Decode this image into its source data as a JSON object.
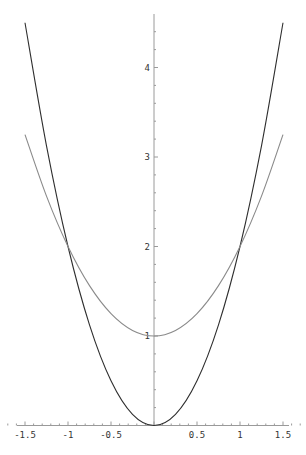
{
  "chart_data": {
    "type": "line",
    "title": "",
    "xlabel": "",
    "ylabel": "",
    "xlim": [
      -1.5,
      1.5
    ],
    "ylim": [
      0,
      4.6
    ],
    "grid": false,
    "legend": null,
    "x_ticks": [
      {
        "value": -1.5,
        "label": "-1.5"
      },
      {
        "value": -1,
        "label": "-1"
      },
      {
        "value": -0.5,
        "label": "-0.5"
      },
      {
        "value": 0.5,
        "label": "0.5"
      },
      {
        "value": 1,
        "label": "1"
      },
      {
        "value": 1.5,
        "label": "1.5"
      }
    ],
    "y_ticks": [
      {
        "value": 1,
        "label": "1"
      },
      {
        "value": 2,
        "label": "2"
      },
      {
        "value": 3,
        "label": "3"
      },
      {
        "value": 4,
        "label": "4"
      }
    ],
    "series": [
      {
        "name": "2x^2",
        "color": "#2e2e2e",
        "x": [
          -1.5,
          -1.25,
          -1,
          -0.75,
          -0.5,
          -0.25,
          0,
          0.25,
          0.5,
          0.75,
          1,
          1.25,
          1.5
        ],
        "values": [
          4.5,
          3.125,
          2,
          1.125,
          0.5,
          0.125,
          0,
          0.125,
          0.5,
          1.125,
          2,
          3.125,
          4.5
        ]
      },
      {
        "name": "x^2+1",
        "color": "#8a8a8a",
        "x": [
          -1.5,
          -1.25,
          -1,
          -0.75,
          -0.5,
          -0.25,
          0,
          0.25,
          0.5,
          0.75,
          1,
          1.25,
          1.5
        ],
        "values": [
          3.25,
          2.5625,
          2,
          1.5625,
          1.25,
          1.0625,
          1,
          1.0625,
          1.25,
          1.5625,
          2,
          2.5625,
          3.25
        ]
      }
    ],
    "annotations": []
  },
  "colors": {
    "axis": "#9a9a9a",
    "tick_label": "#333333",
    "background": "#ffffff"
  }
}
